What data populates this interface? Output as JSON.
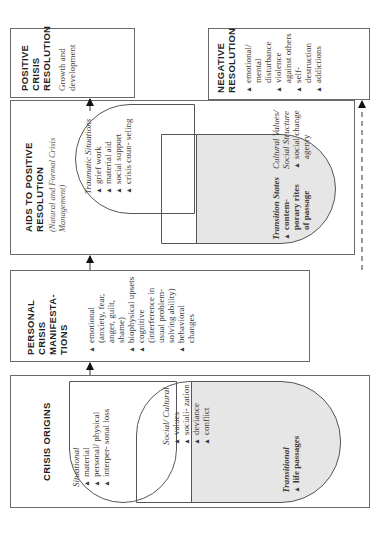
{
  "diagram": {
    "orientation": "rotated 90 degrees counter-clockwise",
    "colors": {
      "border": "#6a6a6a",
      "shaded": "#e6e6e6",
      "text": "#2a2a2a"
    },
    "crisis_origins": {
      "title": "CRISIS ORIGINS",
      "situational": {
        "heading": "Situational",
        "items": [
          "material",
          "personal/ physical",
          "interper- sonal loss"
        ]
      },
      "social_cultural": {
        "heading": "Social/ Cultural",
        "items": [
          "values",
          "sociali- zation",
          "deviance",
          "conflict"
        ]
      },
      "transitional": {
        "heading": "Transitional",
        "items": [
          "life passages"
        ]
      }
    },
    "personal_manifestations": {
      "title": "PERSONAL CRISIS MANIFESTA- TIONS",
      "items": [
        "emotional (anxiety, fear, anger, guilt, shame)",
        "biophysical upsets",
        "cognitive (interference in usual problem- solving ability)",
        "behavioral changes"
      ]
    },
    "aids_to_positive_resolution": {
      "title": "AIDS TO POSITIVE RESOLUTION",
      "subtitle": "(Natural and Formal Crisis Management)",
      "traumatic": {
        "heading": "Traumatic Situations",
        "items": [
          "grief work",
          "material aid",
          "social support",
          "crisis coun- seling"
        ]
      },
      "cultural": {
        "heading": "Cultural Values/ Social Structure",
        "items": [
          "social change agenry"
        ]
      },
      "transition": {
        "heading": "Transition States",
        "items": [
          "contem- porary rites of passage"
        ]
      }
    },
    "positive_resolution": {
      "title": "POSITIVE CRISIS RESOLUTION",
      "text": "Growth and development"
    },
    "negative_resolution": {
      "title": "NEGATIVE RESOLUTION",
      "items": [
        "emotional/ mental disturbance",
        "violence against others",
        "self- destruction",
        "addictions"
      ]
    },
    "bullet_glyph": "▲"
  }
}
